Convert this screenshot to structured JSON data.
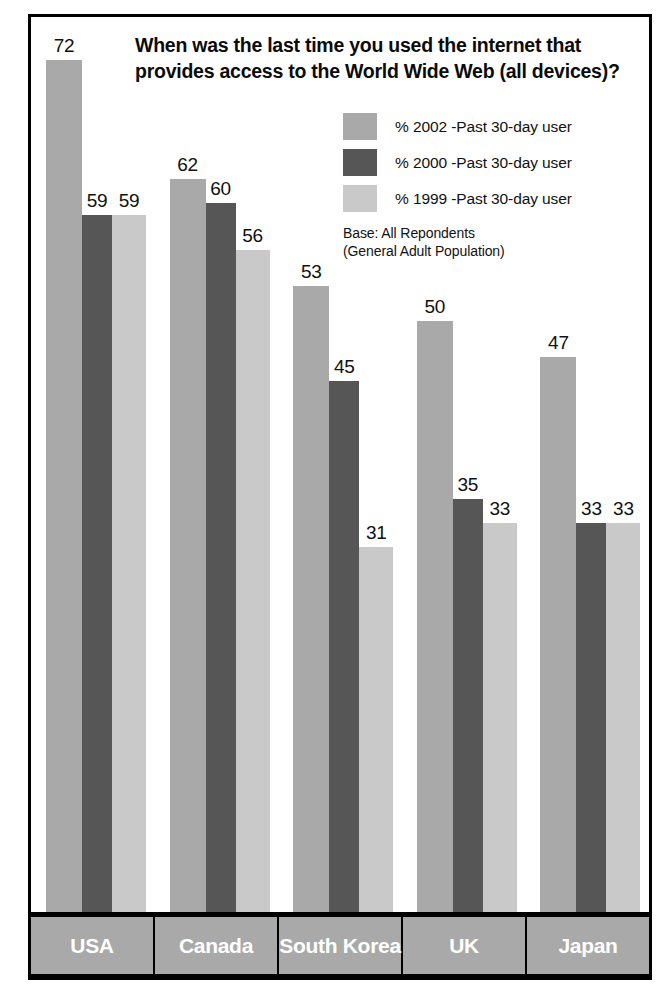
{
  "source_credit": "(Adapted from Ipsos-Reid 2002)",
  "legend": {
    "base_note_line1": "Base: All Repondents",
    "base_note_line2": "(General Adult Population)"
  },
  "colors": {
    "series_2002": "#a9a9a9",
    "series_2000": "#565656",
    "series_1999": "#c9c9c9",
    "frame": "#000000",
    "category_box": "#a9a9a9",
    "category_text": "#ffffff",
    "background": "#ffffff"
  },
  "chart_data": {
    "type": "bar",
    "title": "When was the last time you used the internet that provides access to the World Wide Web (all devices)?",
    "xlabel": "",
    "ylabel": "",
    "ylim": [
      0,
      76
    ],
    "grid": false,
    "legend_position": "top-right",
    "categories": [
      "USA",
      "Canada",
      "South Korea",
      "UK",
      "Japan"
    ],
    "series": [
      {
        "name": "% 2002 -Past 30-day user",
        "color": "#a9a9a9",
        "values": [
          72,
          62,
          53,
          50,
          47
        ]
      },
      {
        "name": "% 2000 -Past 30-day user",
        "color": "#565656",
        "values": [
          59,
          60,
          45,
          35,
          33
        ]
      },
      {
        "name": "% 1999 -Past 30-day user",
        "color": "#c9c9c9",
        "values": [
          59,
          56,
          31,
          33,
          33
        ]
      }
    ],
    "annotations": [
      "Base: All Repondents",
      "(General Adult Population)"
    ]
  }
}
